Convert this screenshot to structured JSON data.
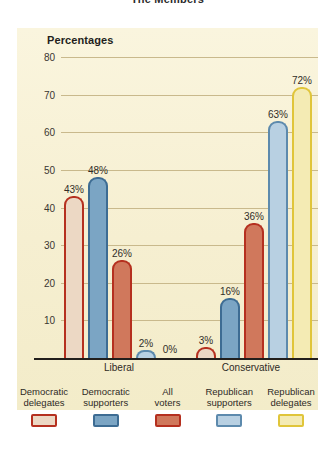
{
  "figure": {
    "title": "The Members",
    "panel_heading": "Percentages"
  },
  "chart_data": {
    "type": "bar",
    "title": "The Members",
    "subtitle": "Percentages",
    "xlabel": "",
    "ylabel": "Percentages",
    "categories": [
      "Liberal",
      "Conservative"
    ],
    "ylim": [
      0,
      80
    ],
    "yticks": [
      10,
      20,
      30,
      40,
      50,
      60,
      70,
      80
    ],
    "ytick_labels": [
      "10",
      "20",
      "30",
      "40",
      "50",
      "60",
      "70",
      "80"
    ],
    "grid": true,
    "legend_position": "bottom",
    "value_suffix": "%",
    "series": [
      {
        "name": "Democratic delegates",
        "values": [
          43,
          3
        ],
        "labels": [
          "43%",
          "3%"
        ],
        "border_color": "#b5301f",
        "fill_color": "#ecd8c4"
      },
      {
        "name": "Democratic supporters",
        "values": [
          48,
          16
        ],
        "labels": [
          "48%",
          "16%"
        ],
        "border_color": "#3d6c93",
        "fill_color": "#7ba5c4"
      },
      {
        "name": "All voters",
        "values": [
          26,
          36
        ],
        "labels": [
          "26%",
          "36%"
        ],
        "border_color": "#b5301f",
        "fill_color": "#d0785c"
      },
      {
        "name": "Republican supporters",
        "values": [
          2,
          63
        ],
        "labels": [
          "2%",
          "63%"
        ],
        "border_color": "#5d8aad",
        "fill_color": "#b8d0e2"
      },
      {
        "name": "Republican delegates",
        "values": [
          0,
          72
        ],
        "labels": [
          "0%",
          "72%"
        ],
        "border_color": "#e0c53a",
        "fill_color": "#f4ebb4"
      }
    ]
  },
  "legend": {
    "items": [
      {
        "line1": "Democratic",
        "line2": "delegates"
      },
      {
        "line1": "Democratic",
        "line2": "supporters"
      },
      {
        "line1": "All",
        "line2": "voters"
      },
      {
        "line1": "Republican",
        "line2": "supporters"
      },
      {
        "line1": "Republican",
        "line2": "delegates"
      }
    ]
  },
  "colors": {
    "panel_background": "#f7f1d5",
    "gridline": "#c9b98c",
    "axis": "#221f1c",
    "text": "#2e2a26"
  }
}
